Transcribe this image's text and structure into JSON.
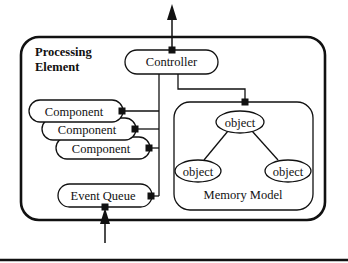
{
  "diagram": {
    "container": {
      "title_line1": "Processing",
      "title_line2": "Element"
    },
    "controller": {
      "label": "Controller"
    },
    "components": [
      {
        "label": "Component"
      },
      {
        "label": "Component"
      },
      {
        "label": "Component"
      }
    ],
    "event_queue": {
      "label": "Event Queue"
    },
    "memory_model": {
      "label": "Memory Model",
      "objects": [
        {
          "label": "object",
          "role": "root"
        },
        {
          "label": "object",
          "role": "left-child"
        },
        {
          "label": "object",
          "role": "right-child"
        }
      ]
    },
    "arrows": [
      {
        "from": "Controller",
        "to": "outside",
        "direction": "up"
      },
      {
        "from": "outside",
        "to": "Event Queue",
        "direction": "up"
      }
    ],
    "colors": {
      "stroke": "#111111",
      "background": "#ffffff"
    }
  }
}
